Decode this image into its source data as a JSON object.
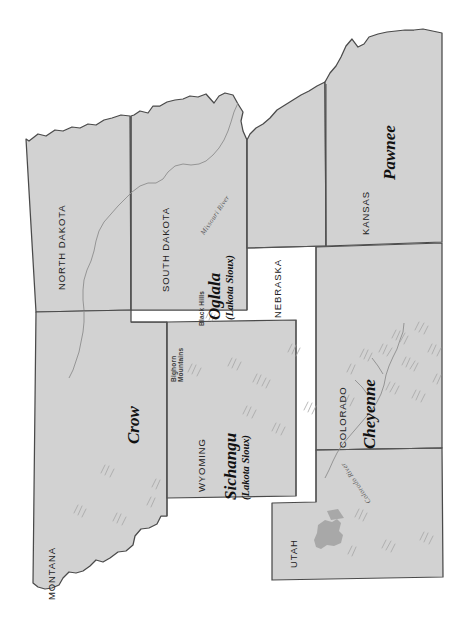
{
  "map": {
    "orientation": "rotated-90-clockwise",
    "background_color": "#ffffff",
    "land_fill_color": "#d2d2d2",
    "border_color": "#4a4a4a",
    "river_color": "#8d8d8d",
    "lake_color": "#a8a8a8",
    "mountain_hachure_color": "#a3a3a3",
    "states": [
      {
        "id": "north-dakota",
        "label": "NORTH DAKOTA"
      },
      {
        "id": "south-dakota",
        "label": "SOUTH DAKOTA"
      },
      {
        "id": "nebraska",
        "label": "NEBRASKA"
      },
      {
        "id": "kansas",
        "label": "KANSAS"
      },
      {
        "id": "montana",
        "label": "MONTANA"
      },
      {
        "id": "wyoming",
        "label": "WYOMING"
      },
      {
        "id": "colorado",
        "label": "COLORADO"
      },
      {
        "id": "utah",
        "label": "UTAH"
      }
    ],
    "tribes": [
      {
        "id": "pawnee",
        "name": "Pawnee",
        "qualifier": ""
      },
      {
        "id": "oglala",
        "name": "Oglala",
        "qualifier": "(Lakota Sioux)"
      },
      {
        "id": "sichangu",
        "name": "Sichangu",
        "qualifier": "(Lakota Sioux)"
      },
      {
        "id": "cheyenne",
        "name": "Cheyenne",
        "qualifier": ""
      },
      {
        "id": "crow",
        "name": "Crow",
        "qualifier": ""
      }
    ],
    "physical_features": [
      {
        "id": "black-hills",
        "label": "Black Hills",
        "type": "hills"
      },
      {
        "id": "bighorn-mountains",
        "label": "Bighorn Mountains",
        "type": "mountains"
      }
    ],
    "rivers": [
      {
        "id": "missouri-river",
        "label": "Missouri River"
      },
      {
        "id": "colorado-river",
        "label": "Colorado River"
      }
    ],
    "lakes": [
      {
        "id": "great-salt-lake",
        "label": ""
      }
    ]
  }
}
